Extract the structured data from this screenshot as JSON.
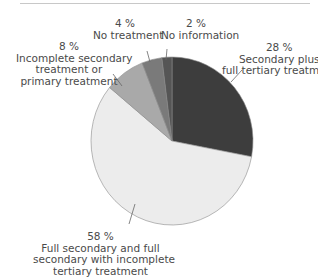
{
  "chart_data": {
    "type": "pie",
    "title": "",
    "start_angle": "12 o'clock",
    "direction": "clockwise",
    "categories": [
      "Secondary plus full tertiary treatment",
      "Full secondary and full secondary with incomplete tertiary treatment",
      "Incomplete secondary treatment or primary treatment",
      "No treatment",
      "No information"
    ],
    "values": [
      28,
      58,
      8,
      4,
      2
    ],
    "unit": "%",
    "colors": [
      "#3d3d3d",
      "#ececec",
      "#a9a9a9",
      "#7a7a7a",
      "#555555"
    ],
    "labels": [
      {
        "pct": "28 %",
        "lines": [
          "Secondary plus",
          "full tertiary treatment"
        ]
      },
      {
        "pct": "58 %",
        "lines": [
          "Full secondary and full",
          "secondary with incomplete",
          "tertiary treatment"
        ]
      },
      {
        "pct": "8 %",
        "lines": [
          "Incomplete secondary",
          "treatment or",
          "primary treatment"
        ]
      },
      {
        "pct": "4 %",
        "lines": [
          "No treatment"
        ]
      },
      {
        "pct": "2 %",
        "lines": [
          "No information"
        ]
      }
    ],
    "legend": "none (direct labels with leader lines)"
  }
}
